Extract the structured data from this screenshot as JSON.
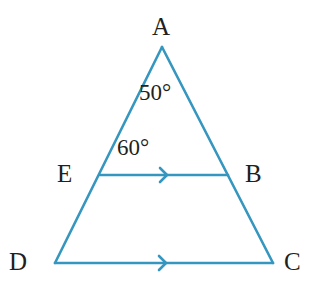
{
  "figure": {
    "type": "geometry-diagram",
    "stroke_color": "#3596bf",
    "text_color": "#231f20",
    "background_color": "#ffffff",
    "stroke_width": 2.6,
    "canvas": {
      "width": 312,
      "height": 297
    }
  },
  "vertices": [
    {
      "id": "A",
      "label": "A",
      "x": 162,
      "y": 47,
      "label_x": 152,
      "label_y": 14
    },
    {
      "id": "B",
      "label": "B",
      "x": 228,
      "y": 175,
      "label_x": 245,
      "label_y": 161
    },
    {
      "id": "C",
      "label": "C",
      "x": 273,
      "y": 263,
      "label_x": 284,
      "label_y": 249
    },
    {
      "id": "D",
      "label": "D",
      "x": 55,
      "y": 263,
      "label_x": 9,
      "label_y": 249
    },
    {
      "id": "E",
      "label": "E",
      "x": 100,
      "y": 175,
      "label_x": 57,
      "label_y": 161
    }
  ],
  "segments": [
    {
      "name": "side-AD",
      "from": "A",
      "to": "D",
      "arrow": false
    },
    {
      "name": "side-AC",
      "from": "A",
      "to": "C",
      "arrow": false
    },
    {
      "name": "base-DC",
      "from": "D",
      "to": "C",
      "arrow": true
    },
    {
      "name": "segment-EB",
      "from": "E",
      "to": "B",
      "arrow": true
    }
  ],
  "angles": [
    {
      "name": "angle-at-A",
      "label": "50°",
      "value": 50,
      "unit": "degrees",
      "at_vertex": "A",
      "label_x": 139,
      "label_y": 81
    },
    {
      "name": "angle-AEB",
      "label": "60°",
      "value": 60,
      "unit": "degrees",
      "at_vertex": "E",
      "label_x": 117,
      "label_y": 136
    }
  ],
  "parallel_marks": [
    {
      "name": "arrow-mark-EB",
      "on_segment": "segment-EB",
      "x": 167,
      "y": 175,
      "count": 1
    },
    {
      "name": "arrow-mark-DC",
      "on_segment": "base-DC",
      "x": 166,
      "y": 263,
      "count": 1
    }
  ]
}
